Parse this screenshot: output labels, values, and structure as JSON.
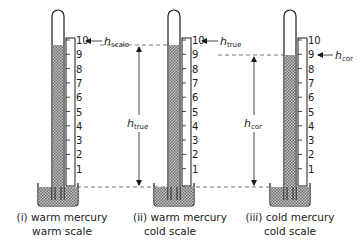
{
  "scale_labels": [
    "1",
    "2",
    "3",
    "4",
    "5",
    "6",
    "7",
    "8",
    "9",
    "10"
  ],
  "thermometers": [
    {
      "id": "i",
      "caption_line1": "(i) warm mercury",
      "caption_line2": "warm scale",
      "mercury_reading": 10,
      "pointer_label": "h",
      "pointer_sub": "scale"
    },
    {
      "id": "ii",
      "caption_line1": "(ii) warm mercury",
      "caption_line2": "cold scale",
      "mercury_reading": 10,
      "pointer_label": "h",
      "pointer_sub": "true",
      "height_label": "h",
      "height_sub": "true"
    },
    {
      "id": "iii",
      "caption_line1": "(iii) cold mercury",
      "caption_line2": "cold scale",
      "mercury_reading": 9,
      "pointer_label": "h",
      "pointer_sub": "cor",
      "height_label": "h",
      "height_sub": "cor"
    }
  ],
  "colors": {
    "ink": "#1a1a1a",
    "mercury": "#8a8a8a"
  }
}
